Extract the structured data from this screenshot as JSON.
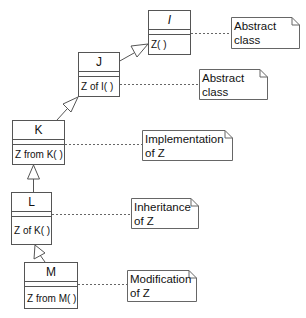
{
  "diagram": {
    "type": "uml-class-hierarchy",
    "classes": [
      {
        "id": "I",
        "name": "I",
        "abstract": true,
        "operation": "Z( )"
      },
      {
        "id": "J",
        "name": "J",
        "abstract": false,
        "operation": "Z of I( )"
      },
      {
        "id": "K",
        "name": "K",
        "abstract": false,
        "operation": "Z from K( )"
      },
      {
        "id": "L",
        "name": "L",
        "abstract": false,
        "operation": "Z of K( )"
      },
      {
        "id": "M",
        "name": "M",
        "abstract": false,
        "operation": "Z from M( )"
      }
    ],
    "notes": [
      {
        "attached_to": "I",
        "line1": "Abstract",
        "line2": "class"
      },
      {
        "attached_to": "J",
        "line1": "Abstract",
        "line2": "class"
      },
      {
        "attached_to": "K",
        "line1": "Implementation",
        "line2": "of Z"
      },
      {
        "attached_to": "L",
        "line1": "Inheritance",
        "line2": "of Z"
      },
      {
        "attached_to": "M",
        "line1": "Modification",
        "line2": "of Z"
      }
    ],
    "generalizations": [
      {
        "from": "J",
        "to": "I"
      },
      {
        "from": "K",
        "to": "J"
      },
      {
        "from": "L",
        "to": "K"
      },
      {
        "from": "M",
        "to": "L"
      }
    ],
    "colors": {
      "line": "#555555",
      "background": "#ffffff",
      "text": "#111111"
    }
  }
}
